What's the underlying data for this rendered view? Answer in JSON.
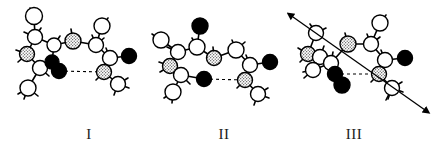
{
  "figure": {
    "background_color": "#ffffff",
    "width": 439,
    "height": 157,
    "style": "ball-and-stick molecular models, line drawing"
  },
  "atom_styles": {
    "open": {
      "name": "open-circle-atom",
      "fill": "#ffffff",
      "stroke": "#000000",
      "description": "carbon / unshaded sphere"
    },
    "filled": {
      "name": "filled-circle-atom",
      "fill": "#000000",
      "stroke": "#000000",
      "description": "oxygen / black sphere"
    },
    "stippled": {
      "name": "stippled-circle-atom",
      "fill": "#d9d9d9",
      "stroke": "#000000",
      "description": "nitrogen / shaded sphere"
    }
  },
  "bond_style": {
    "stroke": "#000000",
    "width": 1.6,
    "hydrogen_bond": {
      "stroke": "#000000",
      "width": 1.1,
      "dash": "3 3"
    }
  },
  "arrow_style": {
    "stroke": "#000000",
    "width": 1.3,
    "heads": "double"
  },
  "panels": [
    {
      "id": "panel-1",
      "label": "I",
      "label_x": 89,
      "label_y": 136,
      "has_hydrogen_bond": true,
      "has_axis_arrow": false,
      "atoms": [
        {
          "n": "a1",
          "type": "open",
          "x": 34,
          "y": 16,
          "r": 8.5
        },
        {
          "n": "a2",
          "type": "open",
          "x": 35,
          "y": 37,
          "r": 7.5
        },
        {
          "n": "a3",
          "type": "stippled",
          "x": 27,
          "y": 54,
          "r": 7.5
        },
        {
          "n": "a4",
          "type": "open",
          "x": 40,
          "y": 68,
          "r": 7.5
        },
        {
          "n": "a5",
          "type": "open",
          "x": 28,
          "y": 88,
          "r": 8.0
        },
        {
          "n": "a6",
          "type": "open",
          "x": 54,
          "y": 45,
          "r": 7.0
        },
        {
          "n": "a7",
          "type": "filled",
          "x": 52,
          "y": 62,
          "r": 7.0
        },
        {
          "n": "a8",
          "type": "filled",
          "x": 59,
          "y": 71,
          "r": 7.5
        },
        {
          "n": "a9",
          "type": "stippled",
          "x": 73,
          "y": 41,
          "r": 8.0
        },
        {
          "n": "a10",
          "type": "open",
          "x": 96,
          "y": 45,
          "r": 7.5
        },
        {
          "n": "a11",
          "type": "open",
          "x": 102,
          "y": 26,
          "r": 8.0
        },
        {
          "n": "a12",
          "type": "open",
          "x": 110,
          "y": 58,
          "r": 7.5
        },
        {
          "n": "a13",
          "type": "filled",
          "x": 129,
          "y": 56,
          "r": 7.5
        },
        {
          "n": "a14",
          "type": "stippled",
          "x": 104,
          "y": 72,
          "r": 7.5
        },
        {
          "n": "a15",
          "type": "open",
          "x": 118,
          "y": 84,
          "r": 7.5
        }
      ],
      "bonds": [
        [
          "a1",
          "a2"
        ],
        [
          "a2",
          "a3"
        ],
        [
          "a3",
          "a4"
        ],
        [
          "a4",
          "a5"
        ],
        [
          "a2",
          "a6"
        ],
        [
          "a6",
          "a7"
        ],
        [
          "a7",
          "a8"
        ],
        [
          "a6",
          "a9"
        ],
        [
          "a9",
          "a10"
        ],
        [
          "a10",
          "a11"
        ],
        [
          "a10",
          "a12"
        ],
        [
          "a12",
          "a13"
        ],
        [
          "a12",
          "a14"
        ],
        [
          "a14",
          "a15"
        ]
      ],
      "hydrogen_bond": [
        "a8",
        "a14"
      ],
      "stubs": [
        [
          34,
          16,
          30,
          8
        ],
        [
          35,
          37,
          24,
          32
        ],
        [
          35,
          37,
          41,
          28
        ],
        [
          27,
          54,
          16,
          50
        ],
        [
          27,
          54,
          18,
          62
        ],
        [
          40,
          68,
          49,
          76
        ],
        [
          28,
          88,
          18,
          94
        ],
        [
          28,
          88,
          24,
          99
        ],
        [
          28,
          88,
          38,
          96
        ],
        [
          54,
          45,
          60,
          36
        ],
        [
          73,
          41,
          71,
          29
        ],
        [
          96,
          45,
          92,
          35
        ],
        [
          96,
          45,
          104,
          38
        ],
        [
          102,
          26,
          108,
          18
        ],
        [
          110,
          58,
          106,
          48
        ],
        [
          104,
          72,
          96,
          80
        ],
        [
          118,
          84,
          128,
          78
        ],
        [
          118,
          84,
          129,
          88
        ],
        [
          118,
          84,
          114,
          95
        ]
      ]
    },
    {
      "id": "panel-2",
      "label": "II",
      "label_x": 224,
      "label_y": 136,
      "has_hydrogen_bond": true,
      "has_axis_arrow": false,
      "atoms": [
        {
          "n": "b1",
          "type": "open",
          "x": 161,
          "y": 40,
          "r": 8.0
        },
        {
          "n": "b2",
          "type": "open",
          "x": 178,
          "y": 52,
          "r": 7.5
        },
        {
          "n": "b3",
          "type": "stippled",
          "x": 170,
          "y": 66,
          "r": 7.5
        },
        {
          "n": "b4",
          "type": "open",
          "x": 181,
          "y": 75,
          "r": 7.5
        },
        {
          "n": "b5",
          "type": "open",
          "x": 173,
          "y": 92,
          "r": 8.0
        },
        {
          "n": "b6",
          "type": "open",
          "x": 197,
          "y": 47,
          "r": 8.0
        },
        {
          "n": "b7",
          "type": "filled",
          "x": 200,
          "y": 26,
          "r": 8.0
        },
        {
          "n": "b8",
          "type": "stippled",
          "x": 214,
          "y": 58,
          "r": 7.5
        },
        {
          "n": "b9",
          "type": "open",
          "x": 236,
          "y": 50,
          "r": 8.0
        },
        {
          "n": "b10",
          "type": "open",
          "x": 250,
          "y": 65,
          "r": 7.5
        },
        {
          "n": "b11",
          "type": "filled",
          "x": 270,
          "y": 62,
          "r": 7.5
        },
        {
          "n": "b12",
          "type": "stippled",
          "x": 245,
          "y": 80,
          "r": 7.5
        },
        {
          "n": "b13",
          "type": "open",
          "x": 258,
          "y": 94,
          "r": 7.5
        },
        {
          "n": "b14",
          "type": "filled",
          "x": 204,
          "y": 79,
          "r": 7.5
        }
      ],
      "bonds": [
        [
          "b1",
          "b2"
        ],
        [
          "b2",
          "b3"
        ],
        [
          "b3",
          "b4"
        ],
        [
          "b4",
          "b5"
        ],
        [
          "b2",
          "b6"
        ],
        [
          "b6",
          "b7"
        ],
        [
          "b6",
          "b8"
        ],
        [
          "b8",
          "b9"
        ],
        [
          "b9",
          "b10"
        ],
        [
          "b10",
          "b11"
        ],
        [
          "b10",
          "b12"
        ],
        [
          "b12",
          "b13"
        ],
        [
          "b4",
          "b14"
        ]
      ],
      "hydrogen_bond": [
        "b14",
        "b12"
      ],
      "stubs": [
        [
          161,
          40,
          152,
          34
        ],
        [
          178,
          52,
          167,
          47
        ],
        [
          170,
          66,
          159,
          62
        ],
        [
          170,
          66,
          160,
          72
        ],
        [
          181,
          75,
          190,
          84
        ],
        [
          173,
          92,
          164,
          98
        ],
        [
          173,
          92,
          172,
          103
        ],
        [
          197,
          47,
          192,
          38
        ],
        [
          214,
          58,
          213,
          47
        ],
        [
          236,
          50,
          232,
          40
        ],
        [
          236,
          50,
          245,
          42
        ],
        [
          250,
          65,
          246,
          55
        ],
        [
          245,
          80,
          237,
          88
        ],
        [
          258,
          94,
          268,
          88
        ],
        [
          258,
          94,
          269,
          98
        ],
        [
          258,
          94,
          254,
          105
        ]
      ]
    },
    {
      "id": "panel-3",
      "label": "III",
      "label_x": 354,
      "label_y": 136,
      "has_hydrogen_bond": true,
      "has_axis_arrow": true,
      "axis_arrow": {
        "x1": 293,
        "y1": 17,
        "x2": 425,
        "y2": 110
      },
      "atoms": [
        {
          "n": "c1",
          "type": "open",
          "x": 316,
          "y": 33,
          "r": 7.5
        },
        {
          "n": "c2",
          "type": "stippled",
          "x": 308,
          "y": 54,
          "r": 7.5
        },
        {
          "n": "c3",
          "type": "open",
          "x": 320,
          "y": 57,
          "r": 7.5
        },
        {
          "n": "c4",
          "type": "open",
          "x": 313,
          "y": 70,
          "r": 7.5
        },
        {
          "n": "c5",
          "type": "open",
          "x": 331,
          "y": 63,
          "r": 7.5
        },
        {
          "n": "c6",
          "type": "filled",
          "x": 335,
          "y": 74,
          "r": 7.5
        },
        {
          "n": "c7",
          "type": "filled",
          "x": 342,
          "y": 85,
          "r": 8.0
        },
        {
          "n": "c8",
          "type": "stippled",
          "x": 348,
          "y": 44,
          "r": 8.0
        },
        {
          "n": "c9",
          "type": "open",
          "x": 371,
          "y": 44,
          "r": 7.5
        },
        {
          "n": "c10",
          "type": "open",
          "x": 380,
          "y": 23,
          "r": 8.0
        },
        {
          "n": "c11",
          "type": "open",
          "x": 385,
          "y": 60,
          "r": 7.5
        },
        {
          "n": "c12",
          "type": "filled",
          "x": 405,
          "y": 58,
          "r": 7.5
        },
        {
          "n": "c13",
          "type": "stippled",
          "x": 379,
          "y": 74,
          "r": 7.5
        },
        {
          "n": "c14",
          "type": "open",
          "x": 392,
          "y": 88,
          "r": 7.5
        }
      ],
      "bonds": [
        [
          "c1",
          "c2"
        ],
        [
          "c2",
          "c3"
        ],
        [
          "c3",
          "c4"
        ],
        [
          "c4",
          "c5"
        ],
        [
          "c3",
          "c5"
        ],
        [
          "c5",
          "c6"
        ],
        [
          "c6",
          "c7"
        ],
        [
          "c5",
          "c8"
        ],
        [
          "c8",
          "c9"
        ],
        [
          "c9",
          "c10"
        ],
        [
          "c9",
          "c11"
        ],
        [
          "c11",
          "c12"
        ],
        [
          "c11",
          "c13"
        ],
        [
          "c13",
          "c14"
        ]
      ],
      "hydrogen_bond": [
        "c6",
        "c13"
      ],
      "stubs": [
        [
          316,
          33,
          310,
          24
        ],
        [
          316,
          33,
          326,
          28
        ],
        [
          308,
          54,
          298,
          48
        ],
        [
          308,
          54,
          300,
          62
        ],
        [
          320,
          57,
          324,
          46
        ],
        [
          313,
          70,
          304,
          78
        ],
        [
          313,
          70,
          303,
          72
        ],
        [
          331,
          63,
          333,
          52
        ],
        [
          348,
          44,
          345,
          33
        ],
        [
          371,
          44,
          367,
          34
        ],
        [
          371,
          44,
          380,
          37
        ],
        [
          380,
          23,
          386,
          15
        ],
        [
          385,
          60,
          381,
          50
        ],
        [
          379,
          74,
          371,
          82
        ],
        [
          392,
          88,
          402,
          82
        ],
        [
          392,
          88,
          403,
          92
        ],
        [
          392,
          88,
          388,
          99
        ],
        [
          392,
          88,
          386,
          100
        ]
      ]
    }
  ]
}
